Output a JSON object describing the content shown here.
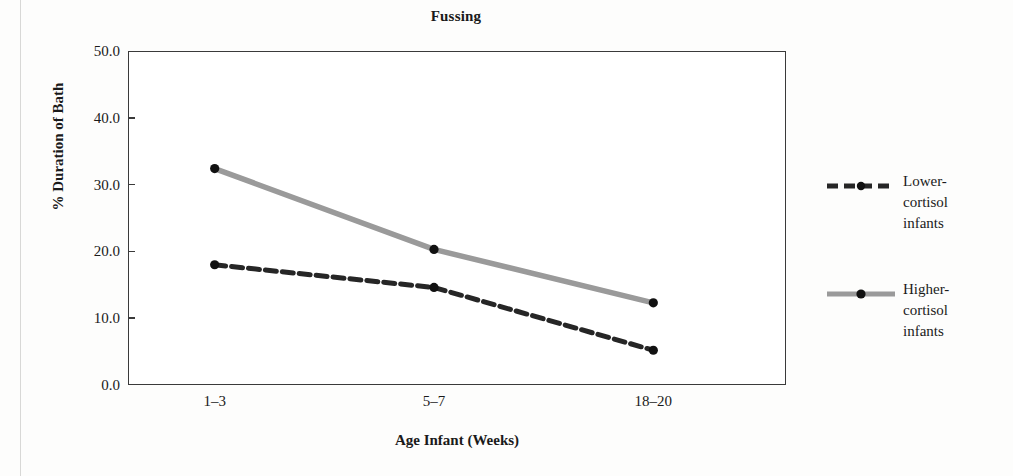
{
  "figure": {
    "title": "Fussing",
    "background_color": "#fdfdfc"
  },
  "axes": {
    "y_title": "% Duration of Bath",
    "x_title": "Age Infant (Weeks)",
    "y_ticks": [
      "0.0",
      "10.0",
      "20.0",
      "30.0",
      "40.0",
      "50.0"
    ],
    "x_ticks": [
      "1–3",
      "5–7",
      "18–20"
    ]
  },
  "legend": {
    "items": [
      {
        "key": "lower",
        "label": "Lower-\ncortisol\ninfants",
        "style": "dashed",
        "color": "#262626",
        "marker": "dot"
      },
      {
        "key": "higher",
        "label": "Higher-\ncortisol\ninfants",
        "style": "solid",
        "color": "#9a9a9a",
        "marker": "dot"
      }
    ]
  },
  "chart_data": {
    "type": "line",
    "title": "Fussing",
    "xlabel": "Age Infant (Weeks)",
    "ylabel": "% Duration of Bath",
    "categories": [
      "1–3",
      "5–7",
      "18–20"
    ],
    "ylim": [
      0.0,
      50.0
    ],
    "ytick_step": 10.0,
    "grid": false,
    "legend_position": "right",
    "series": [
      {
        "name": "Lower-cortisol infants",
        "values": [
          18.0,
          14.6,
          5.2
        ],
        "color": "#262626",
        "linestyle": "dashed",
        "marker": "dot"
      },
      {
        "name": "Higher-cortisol infants",
        "values": [
          32.4,
          20.3,
          12.3
        ],
        "color": "#9a9a9a",
        "linestyle": "solid",
        "marker": "dot"
      }
    ]
  }
}
